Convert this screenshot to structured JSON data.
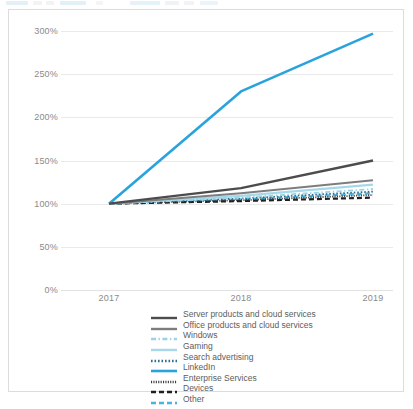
{
  "toolbar": {
    "present": true,
    "note": "partially cropped application toolbar strip at top of screenshot"
  },
  "chart_data": {
    "type": "line",
    "title": "",
    "subtitle": "",
    "xlabel": "",
    "ylabel": "",
    "x": [
      "2017",
      "2018",
      "2019"
    ],
    "categories": [
      "2017",
      "2018",
      "2019"
    ],
    "ylim": [
      0,
      300
    ],
    "ytick_values": [
      0,
      50,
      100,
      150,
      200,
      250,
      300
    ],
    "ytick_labels": [
      "0%",
      "50%",
      "100%",
      "150%",
      "200%",
      "250%",
      "300%"
    ],
    "grid": true,
    "legend_position": "bottom",
    "series": [
      {
        "name": "Server products and cloud services",
        "values": [
          100,
          118,
          150
        ],
        "color": "#4c4c4c",
        "style": "solid",
        "width": 2.4
      },
      {
        "name": "Office products and cloud services",
        "values": [
          100,
          112,
          127
        ],
        "color": "#7d7d7d",
        "style": "solid",
        "width": 2.0
      },
      {
        "name": "Windows",
        "values": [
          100,
          107,
          117
        ],
        "color": "#9bd3e8",
        "style": "dashdot",
        "width": 1.8
      },
      {
        "name": "Gaming",
        "values": [
          100,
          109,
          122
        ],
        "color": "#a7d8ea",
        "style": "solid",
        "width": 2.2
      },
      {
        "name": "Search advertising",
        "values": [
          100,
          106,
          114
        ],
        "color": "#2f6f8f",
        "style": "dotted",
        "width": 1.8
      },
      {
        "name": "LinkedIn",
        "values": [
          100,
          230,
          297
        ],
        "color": "#29a3dc",
        "style": "solid",
        "width": 2.6
      },
      {
        "name": "Enterprise Services",
        "values": [
          100,
          104,
          110
        ],
        "color": "#3a3a3a",
        "style": "fine-dotted",
        "width": 1.8
      },
      {
        "name": "Devices",
        "values": [
          100,
          103,
          107
        ],
        "color": "#1f1f1f",
        "style": "dashed",
        "width": 2.2
      },
      {
        "name": "Other",
        "values": [
          100,
          105,
          112
        ],
        "color": "#45b6df",
        "style": "dashed",
        "width": 2.2
      }
    ]
  },
  "colors": {
    "card_border": "#dcdcdc",
    "gridline": "#e9e9e9",
    "tick_text": "#8a8a8a",
    "legend_text": "#5d5d5d",
    "background": "#ffffff"
  }
}
